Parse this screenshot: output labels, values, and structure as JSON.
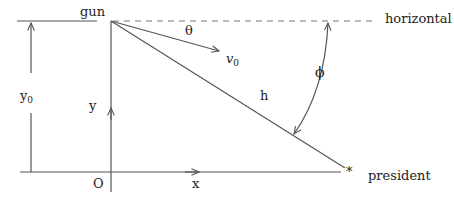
{
  "diagram": {
    "labels": {
      "gun": "gun",
      "horizontal": "horizontal",
      "theta": "θ",
      "v0_main": "v",
      "v0_sub": "0",
      "h": "h",
      "phi": "ϕ",
      "y0_main": "y",
      "y0_sub": "0",
      "y": "y",
      "origin": "O",
      "x": "x",
      "president": "president",
      "asterisk": "*"
    },
    "colors": {
      "line": "#555555",
      "dashed": "#777777",
      "text": "#222222"
    }
  }
}
